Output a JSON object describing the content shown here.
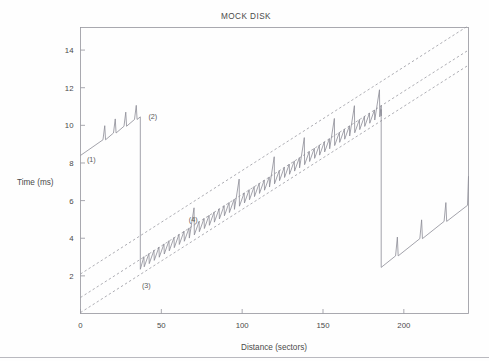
{
  "figure": {
    "title": "MOCK DISK",
    "background": "#fefefe",
    "line_color": "#8b8b95",
    "ref_line_color": "#9898a0",
    "axis_color": "#9a9aa2"
  },
  "axes": {
    "x_label": "Distance (sectors)",
    "y_label": "Time (ms)",
    "x_ticks": [
      0,
      50,
      100,
      150,
      200
    ],
    "y_ticks": [
      2,
      4,
      6,
      8,
      10,
      12,
      14
    ],
    "xlim": [
      0,
      240
    ],
    "ylim": [
      0,
      15.2
    ],
    "grid": false
  },
  "annotations": [
    {
      "id": "1",
      "label": "(1)",
      "x": 4,
      "y": 8.05
    },
    {
      "id": "2",
      "label": "(2)",
      "x": 42,
      "y": 10.35
    },
    {
      "id": "3",
      "label": "(3)",
      "x": 38,
      "y": 1.35
    },
    {
      "id": "4",
      "label": "(4)",
      "x": 67,
      "y": 4.85
    }
  ],
  "chart_data": {
    "type": "line",
    "title": "MOCK DISK",
    "xlabel": "Distance (sectors)",
    "ylabel": "Time (ms)",
    "xlim": [
      0,
      240
    ],
    "ylim": [
      0,
      15.2
    ],
    "x_ticks": [
      0,
      50,
      100,
      150,
      200
    ],
    "y_ticks": [
      2,
      4,
      6,
      8,
      10,
      12,
      14
    ],
    "grid": false,
    "legend": null,
    "series": [
      {
        "name": "reference-line-upper",
        "style": "dashed",
        "comment": "upper dashed seek-time bound",
        "x": [
          0,
          240
        ],
        "y": [
          2.1,
          15.3
        ]
      },
      {
        "name": "reference-line-middle",
        "style": "dashed",
        "comment": "middle dashed seek-time bound",
        "x": [
          0,
          240
        ],
        "y": [
          0.85,
          14.0
        ]
      },
      {
        "name": "reference-line-lower",
        "style": "dashed",
        "comment": "lower dashed seek-time bound",
        "x": [
          0,
          240
        ],
        "y": [
          0.05,
          13.2
        ]
      },
      {
        "name": "measured-access-time",
        "style": "solid",
        "comment": "sawtooth access time with rotational-latency spikes; three rotational wrap segments separated by vertical drops at x=37 and x=186",
        "segments": [
          {
            "name": "segment-1",
            "x_start": 0,
            "x_end": 37,
            "baseline_start": 8.4,
            "baseline_end": 10.45,
            "spike_count": 4,
            "spike_height": 0.75,
            "spike_x": [
              15,
              21.5,
              28,
              34.5
            ],
            "drop_to": 2.35
          },
          {
            "name": "segment-2",
            "x_start": 37,
            "x_end": 186,
            "baseline_start": 2.35,
            "baseline_end": 10.5,
            "sawtooth_period": 3.1,
            "sawtooth_amplitude": 0.55,
            "major_spike_x": [
              68,
              97,
              117,
              137,
              156,
              166,
              182
            ],
            "major_spike_height": 1.45,
            "drop_to": 2.45
          },
          {
            "name": "segment-3",
            "x_start": 186,
            "x_end": 240,
            "baseline_start": 2.45,
            "baseline_end": 5.75,
            "spike_count": 3,
            "spike_height": 1.0,
            "spike_x": [
              196,
              211,
              226
            ],
            "end_spike": 7.3
          }
        ]
      }
    ]
  }
}
